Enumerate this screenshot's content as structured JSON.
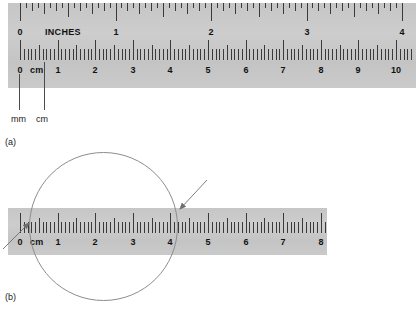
{
  "figure": {
    "panels": [
      {
        "id": "a",
        "caption": "(a)",
        "ruler": {
          "inch_scale": {
            "unit_label": "INCHES",
            "labels": [
              "0",
              "1",
              "2",
              "3",
              "4"
            ],
            "max": 4,
            "subdivisions_per_unit": 16
          },
          "cm_scale": {
            "unit_label": "cm",
            "labels": [
              "0",
              "1",
              "2",
              "3",
              "4",
              "5",
              "6",
              "7",
              "8",
              "9",
              "10"
            ],
            "max": 10,
            "subdivisions_per_unit": 10
          }
        },
        "callouts": [
          {
            "label": "mm",
            "points_to": "millimeter tick"
          },
          {
            "label": "cm",
            "points_to": "centimeter tick"
          }
        ]
      },
      {
        "id": "b",
        "caption": "(b)",
        "ruler": {
          "cm_scale": {
            "unit_label": "cm",
            "labels": [
              "0",
              "1",
              "2",
              "3",
              "4",
              "5",
              "6",
              "7",
              "8"
            ],
            "max": 8,
            "subdivisions_per_unit": 10
          }
        },
        "measured_object": "circle",
        "arrows": [
          {
            "name": "left-edge-arrow",
            "target_value": "0"
          },
          {
            "name": "right-edge-arrow",
            "target_value": "4.7"
          }
        ]
      }
    ]
  },
  "colors": {
    "ruler_face": "#c9c9c9",
    "tick": "#3a3a3a",
    "text": "#111111",
    "annotation": "#8d8d8d"
  }
}
